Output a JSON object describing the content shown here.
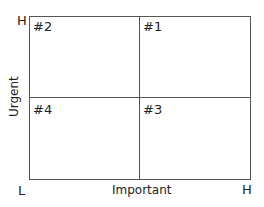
{
  "diagram": {
    "type": "priority-matrix",
    "y_axis": {
      "label": "Urgent",
      "high": "H",
      "low": "L"
    },
    "x_axis": {
      "label": "Important",
      "low": "L",
      "high": "H"
    },
    "quadrants": [
      {
        "position": "top-left",
        "label": "#2"
      },
      {
        "position": "top-right",
        "label": "#1"
      },
      {
        "position": "bottom-left",
        "label": "#4"
      },
      {
        "position": "bottom-right",
        "label": "#3"
      }
    ]
  }
}
